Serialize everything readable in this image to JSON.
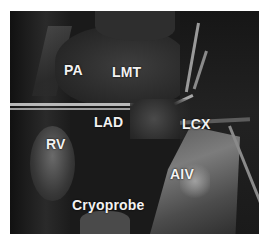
{
  "figure": {
    "type": "surgical photograph (grayscale)",
    "labels": {
      "pa": "PA",
      "lmt": "LMT",
      "lad": "LAD",
      "lcx": "LCX",
      "rv": "RV",
      "aiv": "AIV",
      "cryoprobe": "Cryoprobe"
    }
  }
}
